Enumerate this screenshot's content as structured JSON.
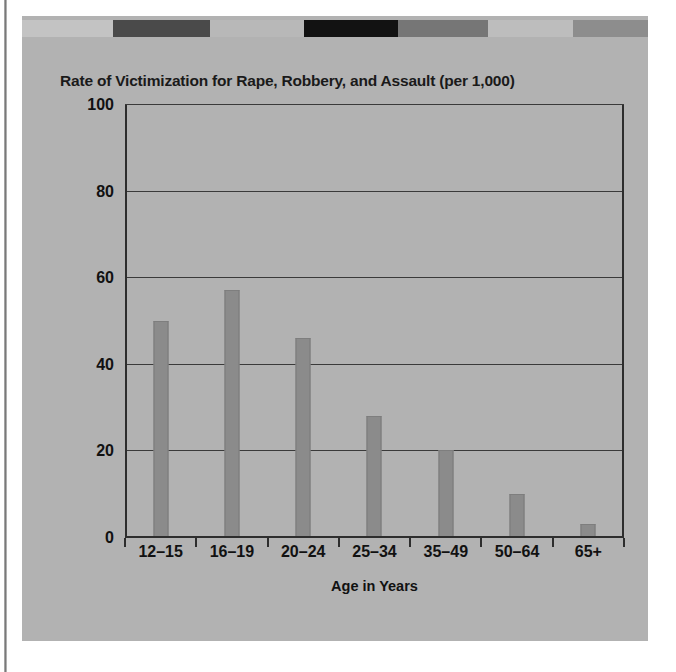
{
  "figure": {
    "panel_color": "#b2b2b2",
    "decor_band": [
      {
        "name": "segment-light-1",
        "color": "#c3c3c3",
        "width_pct": 14.5
      },
      {
        "name": "segment-dark-1",
        "color": "#4a4a4a",
        "width_pct": 15.5
      },
      {
        "name": "segment-light-2",
        "color": "#b8b8b8",
        "width_pct": 15.0
      },
      {
        "name": "segment-black",
        "color": "#121212",
        "width_pct": 15.0
      },
      {
        "name": "segment-mid-1",
        "color": "#767676",
        "width_pct": 14.5
      },
      {
        "name": "segment-light-3",
        "color": "#bdbdbd",
        "width_pct": 13.5
      },
      {
        "name": "segment-mid-2",
        "color": "#8d8d8d",
        "width_pct": 12.0
      }
    ]
  },
  "chart_data": {
    "type": "bar",
    "title": "Rate of Victimization for Rape, Robbery, and Assault (per 1,000)",
    "xlabel": "Age in Years",
    "ylabel": "",
    "categories": [
      "12–15",
      "16–19",
      "20–24",
      "25–34",
      "35–49",
      "50–64",
      "65+"
    ],
    "values": [
      50,
      57,
      46,
      28,
      20,
      10,
      3
    ],
    "ylim": [
      0,
      100
    ],
    "yticks": [
      0,
      20,
      40,
      60,
      80,
      100
    ],
    "ytick_labels": [
      "0",
      "20",
      "40",
      "60",
      "80",
      "100"
    ],
    "grid": true,
    "legend": false,
    "bar_color": "#8b8b8b",
    "axis_color": "#2d2d2d",
    "text_color": "#111111"
  }
}
